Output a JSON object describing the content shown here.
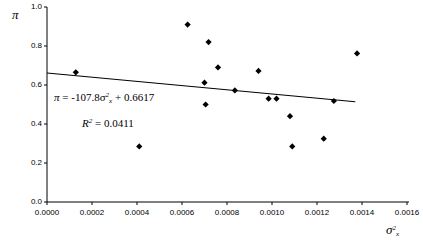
{
  "chart_data": {
    "type": "scatter",
    "title": "",
    "xlabel": "σ²ₓ",
    "ylabel": "π",
    "xlim": [
      0.0,
      0.0016
    ],
    "ylim": [
      0.0,
      1.0
    ],
    "grid": false,
    "legend": null,
    "xticks": [
      "0.0000",
      "0.0002",
      "0.0004",
      "0.0006",
      "0.0008",
      "0.0010",
      "0.0012",
      "0.0014",
      "0.0016"
    ],
    "xtick_values": [
      0.0,
      0.0002,
      0.0004,
      0.0006,
      0.0008,
      0.001,
      0.0012,
      0.0014,
      0.0016
    ],
    "yticks": [
      "0.0",
      "0.2",
      "0.4",
      "0.6",
      "0.8",
      "1.0"
    ],
    "ytick_values": [
      0.0,
      0.2,
      0.4,
      0.6,
      0.8,
      1.0
    ],
    "marker": "diamond",
    "marker_color": "#000000",
    "points": [
      {
        "x": 0.000128,
        "y": 0.665
      },
      {
        "x": 0.00041,
        "y": 0.285
      },
      {
        "x": 0.000625,
        "y": 0.91
      },
      {
        "x": 0.0007,
        "y": 0.612
      },
      {
        "x": 0.000705,
        "y": 0.5
      },
      {
        "x": 0.000718,
        "y": 0.82
      },
      {
        "x": 0.00076,
        "y": 0.69
      },
      {
        "x": 0.000835,
        "y": 0.572
      },
      {
        "x": 0.00094,
        "y": 0.672
      },
      {
        "x": 0.000985,
        "y": 0.53
      },
      {
        "x": 0.00102,
        "y": 0.53
      },
      {
        "x": 0.00108,
        "y": 0.44
      },
      {
        "x": 0.00109,
        "y": 0.285
      },
      {
        "x": 0.00123,
        "y": 0.325
      },
      {
        "x": 0.001275,
        "y": 0.518
      },
      {
        "x": 0.001378,
        "y": 0.762
      }
    ],
    "trendline": {
      "slope": -107.8,
      "intercept": 0.6617,
      "x_start": 0.0,
      "x_end": 0.00137,
      "color": "#000000"
    },
    "annotations": {
      "equation": {
        "pi_symbol": "π",
        "equals": "=",
        "slope_text": "-107.8",
        "sigma_symbol": "σ",
        "sigma_sub": "x",
        "sigma_sup": "2",
        "plus": "+",
        "intercept_text": "0.6617"
      },
      "r_squared": {
        "r_symbol": "R",
        "r_sup": "2",
        "equals": "=",
        "value": "0.0411"
      }
    }
  }
}
